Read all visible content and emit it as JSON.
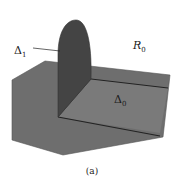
{
  "figure": {
    "caption": "(a)",
    "labels": {
      "delta1": {
        "main": "Δ",
        "sub": "1"
      },
      "delta0": {
        "main": "Δ",
        "sub": "0"
      },
      "r0": {
        "main": "R",
        "sub": "0"
      }
    },
    "colors": {
      "background": "#ffffff",
      "slab": "#6e6e6e",
      "slab_edge": "#2b2b2b",
      "region_delta0": "#797979",
      "half_disk": "#444444",
      "label": "#1a1a1a"
    }
  }
}
